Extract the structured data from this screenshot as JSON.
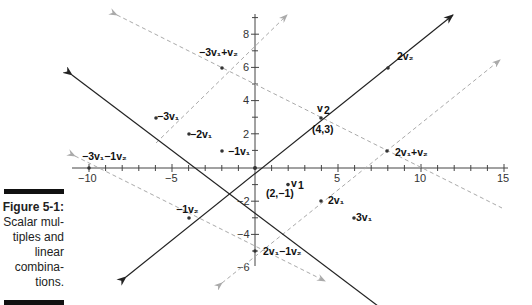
{
  "caption": {
    "title": "Figure 5-1:",
    "lines": [
      "Scalar mul-",
      "tiples and",
      "linear",
      "combina-",
      "tions."
    ]
  },
  "axes": {
    "x_ticks": [
      "−10",
      "−5",
      "5",
      "10",
      "15"
    ],
    "y_ticks": [
      "8",
      "6",
      "4",
      "2",
      "−2",
      "−4",
      "−6"
    ]
  },
  "vectors": {
    "v1": {
      "coords": [
        2,
        -1
      ],
      "label": "v1",
      "coord_label": "(2,−1)"
    },
    "v2": {
      "coords": [
        4,
        3
      ],
      "label": "v2",
      "coord_label": "(4,3)"
    }
  },
  "labels": {
    "v1": "v",
    "v1_sub": "1",
    "v2": "v",
    "v2_sub": "2",
    "v1_coord": "(2,−1)",
    "v2_coord": "(4,3)",
    "two_v1": "2v₁",
    "three_v1": "3v₁",
    "neg1_v1": "−1v₁",
    "neg2_v1": "−2v₁",
    "neg3_v1": "−3v₁",
    "two_v2": "2v₂",
    "neg1_v2": "−1v₂",
    "neg3v1_plus_v2": "−3v₁+v₂",
    "neg3v1_minus_v2": "−3v₁−1v₂",
    "two_v1_plus_v2": "2v₁+v₂",
    "two_v1_minus_v2": "2v₁−1v₂"
  },
  "colors": {
    "solid_line": "#222222",
    "dashed_line": "#b0b0b0",
    "axis": "#444444"
  }
}
